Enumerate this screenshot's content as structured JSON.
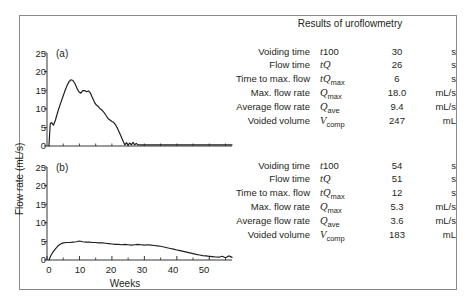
{
  "figure": {
    "background": "#ffffff",
    "border_color": "#8a8a8a",
    "ink_color": "#231f20"
  },
  "results": {
    "title": "Results of uroflowmetry",
    "columns": [
      "Measurement",
      "Symbol",
      "Value",
      "Unit"
    ],
    "panel_a": {
      "rows": [
        {
          "label": "Voiding time",
          "symbol": "t100",
          "symbol_base": "t",
          "symbol_rest": "100",
          "symbol_sub": "",
          "value": "30",
          "unit": "s"
        },
        {
          "label": "Flow time",
          "symbol": "tQ",
          "symbol_base": "t",
          "symbol_rest": "Q",
          "symbol_sub": "",
          "value": "26",
          "unit": "s"
        },
        {
          "label": "Time to max. flow",
          "symbol": "tQmax",
          "symbol_base": "t",
          "symbol_rest": "Q",
          "symbol_sub": "max",
          "value": "6",
          "unit": "s"
        },
        {
          "label": "Max. flow rate",
          "symbol": "Qmax",
          "symbol_base": "",
          "symbol_rest": "Q",
          "symbol_sub": "max",
          "value": "18.0",
          "unit": "mL/s"
        },
        {
          "label": "Average flow rate",
          "symbol": "Qave",
          "symbol_base": "",
          "symbol_rest": "Q",
          "symbol_sub": "ave",
          "value": "9.4",
          "unit": "mL/s"
        },
        {
          "label": "Voided volume",
          "symbol": "Vcomp",
          "symbol_base": "",
          "symbol_rest": "V",
          "symbol_sub": "comp",
          "value": "247",
          "unit": "mL"
        }
      ]
    },
    "panel_b": {
      "rows": [
        {
          "label": "Voiding time",
          "symbol": "t100",
          "symbol_base": "t",
          "symbol_rest": "100",
          "symbol_sub": "",
          "value": "54",
          "unit": "s"
        },
        {
          "label": "Flow time",
          "symbol": "tQ",
          "symbol_base": "t",
          "symbol_rest": "Q",
          "symbol_sub": "",
          "value": "51",
          "unit": "s"
        },
        {
          "label": "Time to max. flow",
          "symbol": "tQmax",
          "symbol_base": "t",
          "symbol_rest": "Q",
          "symbol_sub": "max",
          "value": "12",
          "unit": "s"
        },
        {
          "label": "Max. flow rate",
          "symbol": "Qmax",
          "symbol_base": "",
          "symbol_rest": "Q",
          "symbol_sub": "max",
          "value": "5.3",
          "unit": "mL/s"
        },
        {
          "label": "Average flow rate",
          "symbol": "Qave",
          "symbol_base": "",
          "symbol_rest": "Q",
          "symbol_sub": "ave",
          "value": "3.6",
          "unit": "mL/s"
        },
        {
          "label": "Voided volume",
          "symbol": "Vcomp",
          "symbol_base": "",
          "symbol_rest": "V",
          "symbol_sub": "comp",
          "value": "183",
          "unit": "mL"
        }
      ]
    }
  },
  "chart_data": [
    {
      "type": "line",
      "panel": "(a)",
      "title": "",
      "xlabel": "",
      "ylabel": "Flow rate (mL/s)",
      "xlim": [
        0,
        57
      ],
      "ylim": [
        0,
        25
      ],
      "yticks": [
        0,
        5,
        10,
        15,
        20,
        25
      ],
      "ytick_labels": [
        "0",
        "5",
        "10",
        "15",
        "20",
        "25"
      ],
      "xticks": [],
      "xtick_labels": [],
      "x_minor_ticks": [
        5,
        10,
        15,
        20,
        25,
        30,
        35,
        40,
        45,
        50,
        55
      ],
      "grid": false,
      "legend": "none",
      "x": [
        0.6,
        1.0,
        1.4,
        2.0,
        2.6,
        3.2,
        3.8,
        4.4,
        5.0,
        5.6,
        6.2,
        6.8,
        7.4,
        8.0,
        8.6,
        9.2,
        9.8,
        10.4,
        11.0,
        11.6,
        12.2,
        12.8,
        13.4,
        14.0,
        14.6,
        15.2,
        15.8,
        16.4,
        17.0,
        17.6,
        18.2,
        18.8,
        19.4,
        20.0,
        20.6,
        21.2,
        21.8,
        22.4,
        23.0,
        23.6,
        24.0,
        24.5,
        25.0,
        25.5,
        26.0,
        26.5,
        27.0,
        27.5,
        28.0,
        29.0,
        30.0,
        32.0,
        35.0,
        40.0,
        45.0,
        50.0,
        57.0
      ],
      "y": [
        0.0,
        6.0,
        6.3,
        5.6,
        7.0,
        8.8,
        10.5,
        12.0,
        13.5,
        15.0,
        16.3,
        17.3,
        17.8,
        17.6,
        16.8,
        15.6,
        14.6,
        14.2,
        14.9,
        14.9,
        14.6,
        14.8,
        14.2,
        13.0,
        11.8,
        11.0,
        10.6,
        10.0,
        9.6,
        9.0,
        8.2,
        7.4,
        7.0,
        6.6,
        6.3,
        5.6,
        4.6,
        3.4,
        2.2,
        1.0,
        0.3,
        0.9,
        0.2,
        0.8,
        0.3,
        1.0,
        0.3,
        0.7,
        0.3,
        0.3,
        0.3,
        0.3,
        0.3,
        0.3,
        0.3,
        0.3,
        0.3
      ]
    },
    {
      "type": "line",
      "panel": "(b)",
      "title": "",
      "xlabel": "Weeks",
      "ylabel": "Flow rate (mL/s)",
      "xlim": [
        0,
        57
      ],
      "ylim": [
        0,
        25
      ],
      "yticks": [
        0,
        5,
        10,
        15,
        20,
        25
      ],
      "ytick_labels": [
        "0",
        "5",
        "10",
        "15",
        "20",
        "25"
      ],
      "xticks": [
        0,
        10,
        20,
        30,
        40,
        50
      ],
      "xtick_labels": [
        "0",
        "10",
        "20",
        "30",
        "40",
        "50"
      ],
      "x_minor_ticks": [
        5,
        15,
        25,
        35,
        45,
        55
      ],
      "grid": false,
      "legend": "none",
      "x": [
        0.6,
        1.2,
        1.8,
        2.6,
        3.4,
        4.2,
        5.0,
        6.0,
        7.0,
        8.0,
        9.0,
        10.0,
        11.0,
        12.0,
        13.0,
        14.0,
        15.0,
        16.0,
        17.0,
        18.0,
        19.0,
        20.0,
        21.0,
        22.0,
        23.0,
        24.0,
        25.0,
        26.0,
        27.0,
        28.0,
        29.0,
        30.0,
        31.0,
        32.0,
        33.0,
        34.0,
        35.0,
        36.0,
        37.0,
        38.0,
        39.0,
        40.0,
        41.0,
        42.0,
        43.0,
        44.0,
        45.0,
        46.0,
        47.0,
        48.0,
        49.0,
        50.0,
        51.0,
        52.0,
        53.0,
        54.0,
        55.0,
        56.0,
        57.0
      ],
      "y": [
        0.0,
        1.2,
        2.1,
        3.0,
        3.8,
        4.3,
        4.6,
        4.7,
        4.7,
        4.8,
        4.9,
        5.1,
        4.9,
        4.8,
        4.8,
        4.7,
        4.7,
        4.6,
        4.6,
        4.5,
        4.4,
        4.3,
        4.2,
        4.2,
        4.1,
        4.2,
        4.1,
        4.0,
        4.1,
        4.2,
        4.1,
        4.0,
        4.1,
        4.0,
        3.9,
        3.8,
        3.7,
        3.5,
        3.3,
        3.1,
        2.9,
        2.7,
        2.5,
        2.3,
        2.1,
        1.9,
        1.7,
        1.5,
        1.35,
        1.2,
        1.1,
        1.0,
        0.9,
        0.8,
        0.75,
        1.0,
        0.6,
        1.1,
        0.7
      ]
    }
  ]
}
